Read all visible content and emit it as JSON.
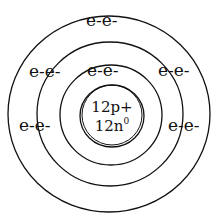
{
  "diagram": {
    "nucleus": {
      "protons": "12p+",
      "neutrons_base": "12n",
      "neutrons_sup": "0"
    },
    "shells": [
      {
        "name": "shell-1",
        "electrons": [
          {
            "label": "e-e-",
            "position": "top"
          }
        ]
      },
      {
        "name": "shell-2",
        "electrons": [
          {
            "label": "e-e-",
            "position": "upper-left"
          },
          {
            "label": "e-e-",
            "position": "upper-right"
          },
          {
            "label": "e-e-",
            "position": "left"
          },
          {
            "label": "e-e-",
            "position": "right"
          }
        ]
      },
      {
        "name": "shell-3",
        "electrons": [
          {
            "label": "e-e-",
            "position": "top"
          }
        ]
      }
    ],
    "colors": {
      "line": "#111111",
      "background": "#ffffff"
    }
  }
}
